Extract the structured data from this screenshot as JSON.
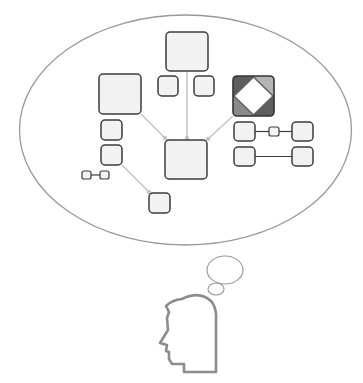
{
  "diagram": {
    "title": "",
    "colors": {
      "background": "#ffffff",
      "bubble_stroke": "#9a9a9a",
      "box_fill": "#f2f2f2",
      "box_stroke": "#3c3c3c",
      "connector": "#c4c4c4",
      "link_line": "#3c3c3c",
      "head_stroke": "#8c8c8c",
      "diamond_dark": "#5e5e5e",
      "diamond_mid": "#8a8a8a",
      "diamond_light": "#b4b4b4",
      "diamond_center": "#ffffff"
    },
    "thought_bubble": {
      "cx": 185.5,
      "cy": 130,
      "rx": 166,
      "ry": 115
    },
    "trail_bubbles": [
      {
        "cx": 225,
        "cy": 270,
        "rx": 18,
        "ry": 14
      },
      {
        "cx": 216,
        "cy": 289,
        "rx": 8,
        "ry": 6
      }
    ],
    "nodes": [
      {
        "id": "top-large",
        "x": 166,
        "y": 32,
        "w": 42,
        "h": 39,
        "size": "large"
      },
      {
        "id": "top-small-left",
        "x": 158,
        "y": 76,
        "w": 20,
        "h": 20,
        "size": "small"
      },
      {
        "id": "top-small-right",
        "x": 194,
        "y": 76,
        "w": 20,
        "h": 20,
        "size": "small"
      },
      {
        "id": "left-large",
        "x": 99,
        "y": 74,
        "w": 42,
        "h": 40,
        "size": "large"
      },
      {
        "id": "left-small-1",
        "x": 101,
        "y": 120,
        "w": 21,
        "h": 20,
        "size": "small"
      },
      {
        "id": "left-small-2",
        "x": 101,
        "y": 145,
        "w": 21,
        "h": 20,
        "size": "small"
      },
      {
        "id": "center-large",
        "x": 165,
        "y": 140,
        "w": 42,
        "h": 39,
        "size": "large"
      },
      {
        "id": "bottom-small",
        "x": 149,
        "y": 193,
        "w": 21,
        "h": 20,
        "size": "small"
      },
      {
        "id": "right-row1-left",
        "x": 234,
        "y": 122,
        "w": 21,
        "h": 19,
        "size": "small"
      },
      {
        "id": "right-row1-right",
        "x": 292,
        "y": 122,
        "w": 21,
        "h": 19,
        "size": "small"
      },
      {
        "id": "right-row2-left",
        "x": 234,
        "y": 147,
        "w": 21,
        "h": 19,
        "size": "small"
      },
      {
        "id": "right-row2-right",
        "x": 292,
        "y": 147,
        "w": 21,
        "h": 19,
        "size": "small"
      }
    ],
    "mini_nodes": [
      {
        "id": "right-row1-mini",
        "x": 269,
        "y": 127,
        "w": 10,
        "h": 9
      },
      {
        "id": "left-mini-a",
        "x": 82,
        "y": 171,
        "w": 9,
        "h": 8
      },
      {
        "id": "left-mini-b",
        "x": 100,
        "y": 171,
        "w": 9,
        "h": 8
      }
    ],
    "feature_node": {
      "id": "diamond-box",
      "x": 233,
      "y": 76,
      "w": 41,
      "h": 40,
      "icon": "diamond-icon"
    },
    "connectors": [
      {
        "from": "left-large",
        "x1": 141,
        "y1": 114,
        "x2": 165,
        "y2": 138
      },
      {
        "from": "top-large",
        "x1": 187,
        "y1": 71,
        "x2": 187,
        "y2": 138
      },
      {
        "from": "diamond-box",
        "x1": 233,
        "y1": 116,
        "x2": 208,
        "y2": 139
      },
      {
        "from": "left-small-2",
        "x1": 122,
        "y1": 165,
        "x2": 149,
        "y2": 192
      }
    ],
    "links": [
      {
        "x1": 255,
        "y1": 131.5,
        "x2": 269,
        "y2": 131.5
      },
      {
        "x1": 279,
        "y1": 131.5,
        "x2": 292,
        "y2": 131.5
      },
      {
        "x1": 255,
        "y1": 156.5,
        "x2": 292,
        "y2": 156.5
      },
      {
        "x1": 91,
        "y1": 175,
        "x2": 100,
        "y2": 175
      }
    ],
    "head": {
      "icon": "head-profile-icon",
      "path": "M 182 299 Q 200 290 212 302 Q 217 310 216 320 L 216 372 L 184 372 L 184 364 L 172 364 L 169 359 L 169 352 L 166 351 L 167 345 L 160 343 L 168 330 L 167 318 L 169 312 L 166 306 Q 172 300 182 299 Z"
    }
  }
}
